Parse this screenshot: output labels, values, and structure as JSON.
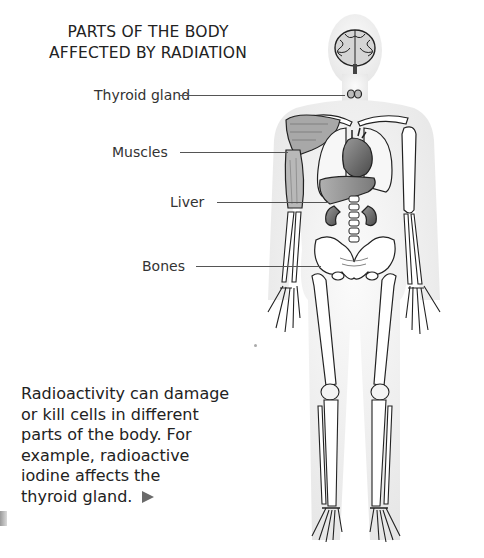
{
  "diagram": {
    "title_line1": "PARTS OF THE BODY",
    "title_line2": "AFFECTED BY RADIATION",
    "labels": [
      {
        "text": "Thyroid gland",
        "target": "thyroid"
      },
      {
        "text": "Muscles",
        "target": "arm-muscle"
      },
      {
        "text": "Liver",
        "target": "liver"
      },
      {
        "text": "Bones",
        "target": "pelvis"
      }
    ],
    "caption": "Radioactivity can damage or kill cells in different parts of the body. For example, radioactive iodine affects the thyroid gland.",
    "caption_lines": [
      "Radioactivity can damage",
      "or kill cells in different",
      "parts of the body. For",
      "example, radioactive",
      "iodine affects the",
      "thyroid gland."
    ],
    "figure_subject": "human body with skeleton, brain, thyroid, heart, lungs, liver, kidneys and arm muscle",
    "colors": {
      "text": "#222222",
      "leader_line": "#555555",
      "body_silhouette": "#ececec",
      "organ_dark": "#5a5a5a",
      "arrow": "#6a6a6a"
    }
  }
}
